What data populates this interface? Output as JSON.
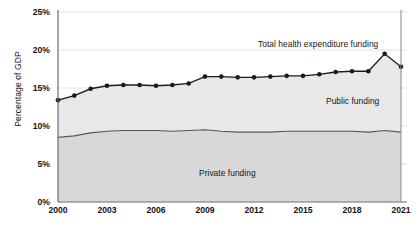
{
  "chart_data": {
    "type": "area",
    "title": "",
    "subtitle": "",
    "xlabel": "",
    "ylabel": "Percentage of GDP",
    "xlim": [
      2000,
      2021
    ],
    "ylim": [
      0,
      25
    ],
    "ytick_labels": [
      "0%",
      "5%",
      "10%",
      "15%",
      "20%",
      "25%"
    ],
    "ytick_values": [
      0,
      5,
      10,
      15,
      20,
      25
    ],
    "xtick_labels": [
      "2000",
      "2003",
      "2006",
      "2009",
      "2012",
      "2015",
      "2018",
      "2021"
    ],
    "xtick_values": [
      2000,
      2003,
      2006,
      2009,
      2012,
      2015,
      2018,
      2021
    ],
    "grid": "horizontal",
    "legend_position": "inline-annotations",
    "x": [
      2000,
      2001,
      2002,
      2003,
      2004,
      2005,
      2006,
      2007,
      2008,
      2009,
      2010,
      2011,
      2012,
      2013,
      2014,
      2015,
      2016,
      2017,
      2018,
      2019,
      2020,
      2021
    ],
    "series": [
      {
        "name": "Total health expenditure funding",
        "marker": "circle",
        "color": "#1a1a1a",
        "values": [
          13.4,
          14.0,
          14.9,
          15.3,
          15.4,
          15.4,
          15.3,
          15.4,
          15.6,
          16.5,
          16.5,
          16.4,
          16.4,
          16.5,
          16.6,
          16.6,
          16.8,
          17.1,
          17.2,
          17.2,
          19.5,
          17.8
        ]
      },
      {
        "name": "Public funding",
        "marker": "none",
        "color": "#4d4d4d",
        "values": [
          8.5,
          8.7,
          9.1,
          9.3,
          9.4,
          9.4,
          9.4,
          9.3,
          9.4,
          9.5,
          9.3,
          9.2,
          9.2,
          9.2,
          9.3,
          9.3,
          9.3,
          9.3,
          9.3,
          9.2,
          9.4,
          9.2
        ]
      }
    ],
    "annotations": [
      {
        "text": "Total health expenditure funding",
        "x_px": 258,
        "y_px": 39,
        "band": "above-total"
      },
      {
        "text": "Public funding",
        "x_px": 326,
        "y_px": 96,
        "band": "between-public-and-total"
      },
      {
        "text": "Private funding",
        "x_px": 199,
        "y_px": 168,
        "band": "below-public"
      }
    ],
    "band_fills": {
      "private_funding": "#d9d9d9",
      "public_funding": "#e6e6e6"
    }
  }
}
